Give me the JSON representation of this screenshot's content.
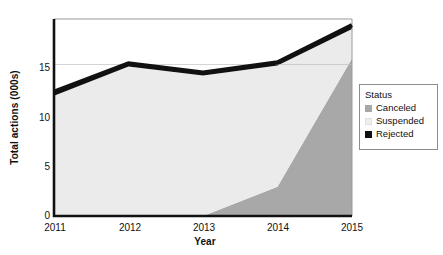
{
  "chart_data": {
    "type": "area",
    "title": "",
    "subtitle": "",
    "xlabel": "Year",
    "ylabel": "Total actions (000s)",
    "categories": [
      "2011",
      "2012",
      "2013",
      "2014",
      "2015"
    ],
    "x": [
      2011,
      2012,
      2013,
      2014,
      2015
    ],
    "stacked": true,
    "series": [
      {
        "name": "Canceled",
        "color": "#a8a8a8",
        "values": [
          0,
          0,
          0,
          2.9,
          15.6
        ]
      },
      {
        "name": "Suspended",
        "color": "#ebebeb",
        "values": [
          11.9,
          14.8,
          13.9,
          12.0,
          2.9
        ]
      },
      {
        "name": "Rejected",
        "color": "#111111",
        "values": [
          0.4,
          0.35,
          0.3,
          0.35,
          0.4
        ]
      }
    ],
    "totals": [
      12.3,
      15.1,
      14.2,
      15.2,
      18.9
    ],
    "xlim": [
      2011,
      2015
    ],
    "ylim": [
      0,
      19.5
    ],
    "yticks": [
      0,
      5,
      10,
      15
    ],
    "ytick_labels": [
      "0",
      "5",
      "10",
      "15"
    ],
    "xticks": [
      2011,
      2012,
      2013,
      2014,
      2015
    ],
    "xtick_labels": [
      "2011",
      "2012",
      "2013",
      "2014",
      "2015"
    ],
    "grid": "horizontal-at-15",
    "gridline_color": "#bfbfbf",
    "legend_position": "right",
    "plot_border_color": "#9a9a9a",
    "axis_color": "#111111",
    "background": "#ffffff"
  },
  "legend": {
    "title": "Status",
    "entries": [
      {
        "label": "Canceled",
        "color": "#a8a8a8"
      },
      {
        "label": "Suspended",
        "color": "#efefef"
      },
      {
        "label": "Rejected",
        "color": "#111111"
      }
    ]
  },
  "axes": {
    "y_title": "Total actions (000s)",
    "x_title": "Year",
    "y_tick_labels": [
      "15",
      "10",
      "5",
      "0"
    ],
    "x_tick_labels": [
      "2011",
      "2012",
      "2013",
      "2014",
      "2015"
    ]
  }
}
